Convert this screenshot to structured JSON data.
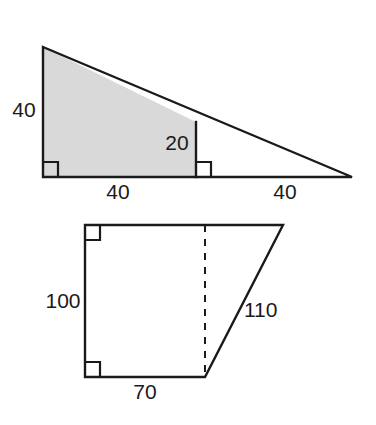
{
  "page": {
    "background_color": "#ffffff",
    "ink_color": "#1a1a1a",
    "shaded_fill_color": "#d9d9d9",
    "width": 376,
    "height": 425
  },
  "figures": [
    {
      "id": "top-triangle-figure",
      "name": "shaded-subtriangle-in-right-triangle",
      "description": "Right triangle divided by a vertical segment into a shaded left trapezoid and an unshaded right triangle",
      "shaded": true,
      "geometry": {
        "apex": [
          43,
          47
        ],
        "bottom_left": [
          43,
          177
        ],
        "bottom_right": [
          352,
          177
        ],
        "divider_x": 196,
        "divider_top": [
          196,
          122
        ],
        "divider_bottom": [
          196,
          177
        ]
      },
      "labels": [
        {
          "name": "left-height-label",
          "text": "40",
          "x": 24,
          "y": 111,
          "anchor": "middle"
        },
        {
          "name": "divider-height-label",
          "text": "20",
          "x": 177,
          "y": 144,
          "anchor": "middle"
        },
        {
          "name": "base-left-label",
          "text": "40",
          "x": 118,
          "y": 193,
          "anchor": "middle"
        },
        {
          "name": "base-right-label",
          "text": "40",
          "x": 285,
          "y": 193,
          "anchor": "middle"
        }
      ],
      "right_angles": [
        {
          "name": "right-angle-bottom-left",
          "x": 43,
          "y": 177,
          "dir_x": 1,
          "dir_y": -1,
          "size": 15
        },
        {
          "name": "right-angle-bottom-divider",
          "x": 196,
          "y": 177,
          "dir_x": 1,
          "dir_y": -1,
          "size": 15
        }
      ]
    },
    {
      "id": "bottom-trapezoid-figure",
      "name": "right-trapezoid-with-altitude",
      "description": "Right trapezoid with vertical left side, horizontal top and bottom, slanted right side, and a dashed altitude",
      "shaded": false,
      "geometry": {
        "top_left": [
          85,
          225
        ],
        "top_right": [
          283,
          225
        ],
        "bottom_right": [
          205,
          377
        ],
        "bottom_left": [
          85,
          377
        ],
        "dashed_top": [
          205,
          225
        ],
        "dashed_bottom": [
          205,
          377
        ]
      },
      "labels": [
        {
          "name": "left-side-label",
          "text": "100",
          "x": 63,
          "y": 302,
          "anchor": "middle"
        },
        {
          "name": "slant-side-label",
          "text": "110",
          "x": 244,
          "y": 311,
          "anchor": "start"
        },
        {
          "name": "bottom-side-label",
          "text": "70",
          "x": 145,
          "y": 393,
          "anchor": "middle"
        }
      ],
      "right_angles": [
        {
          "name": "right-angle-top-left",
          "x": 85,
          "y": 225,
          "dir_x": 1,
          "dir_y": 1,
          "size": 15
        },
        {
          "name": "right-angle-bottom-left",
          "x": 85,
          "y": 377,
          "dir_x": 1,
          "dir_y": -1,
          "size": 15
        }
      ]
    }
  ]
}
